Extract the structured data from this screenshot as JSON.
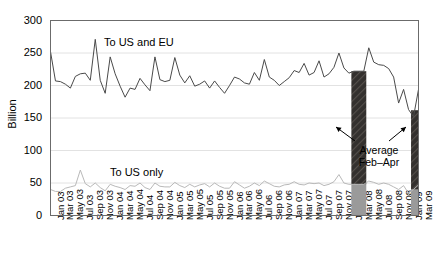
{
  "chart_data": {
    "type": "line",
    "title": "",
    "xlabel": "",
    "ylabel": "Billion",
    "ylim": [
      0,
      300
    ],
    "yticks": [
      0,
      50,
      100,
      150,
      200,
      250,
      300
    ],
    "ytick_labels": [
      "0",
      "50",
      "100",
      "150",
      "200",
      "250",
      "300"
    ],
    "grid": true,
    "legend_position": "inline-annotations",
    "xtick_labels": [
      "Jan 03",
      "Mar 03",
      "May 03",
      "Jul 03",
      "Sep 03",
      "Nov 03",
      "Jan 04",
      "Mar 04",
      "May 04",
      "Jul 04",
      "Sep 04",
      "Nov 04",
      "Jan 05",
      "Mar 05",
      "May 05",
      "Jul 05",
      "Sep 05",
      "Nov 05",
      "Jan 06",
      "Mar 06",
      "May 06",
      "Jul 06",
      "Sep 06",
      "Nov 06",
      "Jan 07",
      "Mar 07",
      "May 07",
      "Jul 07",
      "Sep 07",
      "Nov 07",
      "Jan 08",
      "Mar 08",
      "May 08",
      "Jul 08",
      "Sep 08",
      "Nov 08",
      "Jan 09",
      "Mar 09"
    ],
    "x": [
      "Jan 03",
      "Feb 03",
      "Mar 03",
      "Apr 03",
      "May 03",
      "Jun 03",
      "Jul 03",
      "Aug 03",
      "Sep 03",
      "Oct 03",
      "Nov 03",
      "Dec 03",
      "Jan 04",
      "Feb 04",
      "Mar 04",
      "Apr 04",
      "May 04",
      "Jun 04",
      "Jul 04",
      "Aug 04",
      "Sep 04",
      "Oct 04",
      "Nov 04",
      "Dec 04",
      "Jan 05",
      "Feb 05",
      "Mar 05",
      "Apr 05",
      "May 05",
      "Jun 05",
      "Jul 05",
      "Aug 05",
      "Sep 05",
      "Oct 05",
      "Nov 05",
      "Dec 05",
      "Jan 06",
      "Feb 06",
      "Mar 06",
      "Apr 06",
      "May 06",
      "Jun 06",
      "Jul 06",
      "Aug 06",
      "Sep 06",
      "Oct 06",
      "Nov 06",
      "Dec 06",
      "Jan 07",
      "Feb 07",
      "Mar 07",
      "Apr 07",
      "May 07",
      "Jun 07",
      "Jul 07",
      "Aug 07",
      "Sep 07",
      "Oct 07",
      "Nov 07",
      "Dec 07",
      "Jan 08",
      "Feb 08",
      "Mar 08",
      "Apr 08",
      "May 08",
      "Jun 08",
      "Jul 08",
      "Aug 08",
      "Sep 08",
      "Oct 08",
      "Nov 08",
      "Dec 08",
      "Jan 09",
      "Feb 09",
      "Mar 09"
    ],
    "series": [
      {
        "name": "To US and EU",
        "color": "#4a4a4a",
        "values": [
          252,
          207,
          206,
          202,
          196,
          214,
          218,
          219,
          208,
          271,
          208,
          188,
          244,
          218,
          199,
          182,
          196,
          194,
          211,
          201,
          192,
          244,
          209,
          206,
          208,
          243,
          216,
          204,
          215,
          199,
          202,
          207,
          196,
          207,
          197,
          188,
          200,
          213,
          210,
          204,
          202,
          220,
          208,
          240,
          213,
          208,
          200,
          206,
          212,
          223,
          220,
          234,
          216,
          220,
          238,
          213,
          218,
          228,
          250,
          227,
          219,
          222,
          222,
          222,
          258,
          236,
          232,
          231,
          226,
          213,
          173,
          194,
          163,
          152,
          194
        ]
      },
      {
        "name": "To US only",
        "color": "#b9b9b9",
        "values": [
          40,
          37,
          37,
          42,
          44,
          46,
          70,
          49,
          44,
          50,
          43,
          38,
          48,
          45,
          43,
          40,
          46,
          45,
          50,
          43,
          40,
          50,
          45,
          44,
          44,
          51,
          46,
          43,
          48,
          44,
          47,
          49,
          44,
          50,
          45,
          42,
          42,
          52,
          47,
          42,
          45,
          50,
          46,
          53,
          49,
          45,
          44,
          47,
          48,
          52,
          48,
          47,
          50,
          49,
          50,
          46,
          48,
          52,
          63,
          50,
          48,
          48,
          48,
          48,
          53,
          51,
          48,
          50,
          48,
          44,
          40,
          46,
          34,
          40,
          47
        ]
      }
    ],
    "bars": [
      {
        "label": "Feb 08",
        "period": "Feb-Apr 08",
        "x_start": "Feb 08",
        "x_end": "Apr 08",
        "total": 222,
        "lower_value": 48,
        "lower_color": "#9a9a9a",
        "upper_color": "#33302e"
      },
      {
        "label": "Feb 09",
        "period": "Feb-Apr 09",
        "x_start": "Feb 09",
        "x_end": "Mar 09",
        "total": 162,
        "lower_value": 40,
        "lower_color": "#9a9a9a",
        "upper_color": "#33302e"
      }
    ],
    "annotations": [
      {
        "name": "average-feb-apr",
        "line1": "Average",
        "line2": "Feb–Apr"
      }
    ],
    "series_inline_labels": [
      {
        "name": "to-us-and-eu",
        "text": "To US and EU"
      },
      {
        "name": "to-us-only",
        "text": "To US only"
      }
    ]
  }
}
